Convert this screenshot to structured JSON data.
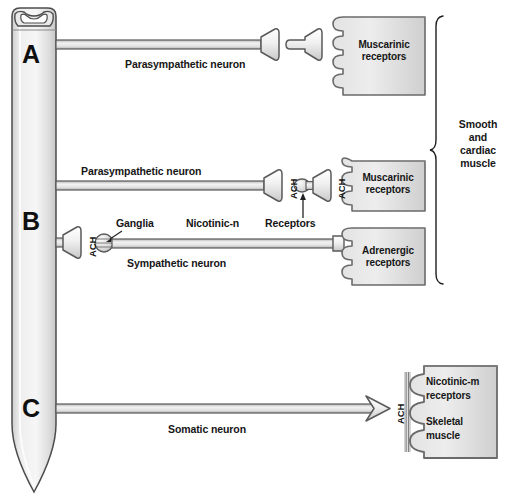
{
  "figure": {
    "background": "#ffffff",
    "ink": "#161616",
    "fill_light": "#f2f2f2",
    "fill_mid": "#d9d9d9",
    "stroke": "#5a5a5a"
  },
  "spinal_cord": {
    "name": "spinal cord",
    "gray_matter": "butterfly-gray-matter"
  },
  "branch_letters": [
    {
      "id": "A",
      "label": "A"
    },
    {
      "id": "B",
      "label": "B"
    },
    {
      "id": "C",
      "label": "C"
    }
  ],
  "pathways": {
    "a": {
      "neuron_label": "Parasympathetic neuron",
      "target_box": {
        "line1": "Muscarinic",
        "line2": "receptors"
      }
    },
    "b_parasympathetic": {
      "neuron_label": "Parasympathetic neuron",
      "ach_pre": "ACH",
      "ach_post": "ACH",
      "target_box": {
        "line1": "Muscarinic",
        "line2": "receptors"
      }
    },
    "b_sympathetic": {
      "neuron_label": "Sympathetic neuron",
      "ach_pre": "ACH",
      "ganglia_label": "Ganglia",
      "nicotinic_label": "Nicotinic-n",
      "receptors_label": "Receptors",
      "target_box": {
        "line1": "Adrenergic",
        "line2": "receptors"
      }
    },
    "c_somatic": {
      "neuron_label": "Somatic neuron",
      "ach": "ACH",
      "target_box": {
        "line1": "Nicotinic-m",
        "line2": "receptors",
        "line3": "Skeletal",
        "line4": "muscle"
      }
    }
  },
  "brace": {
    "label_line1": "Smooth",
    "label_line2": "and",
    "label_line3": "cardiac",
    "label_line4": "muscle"
  }
}
